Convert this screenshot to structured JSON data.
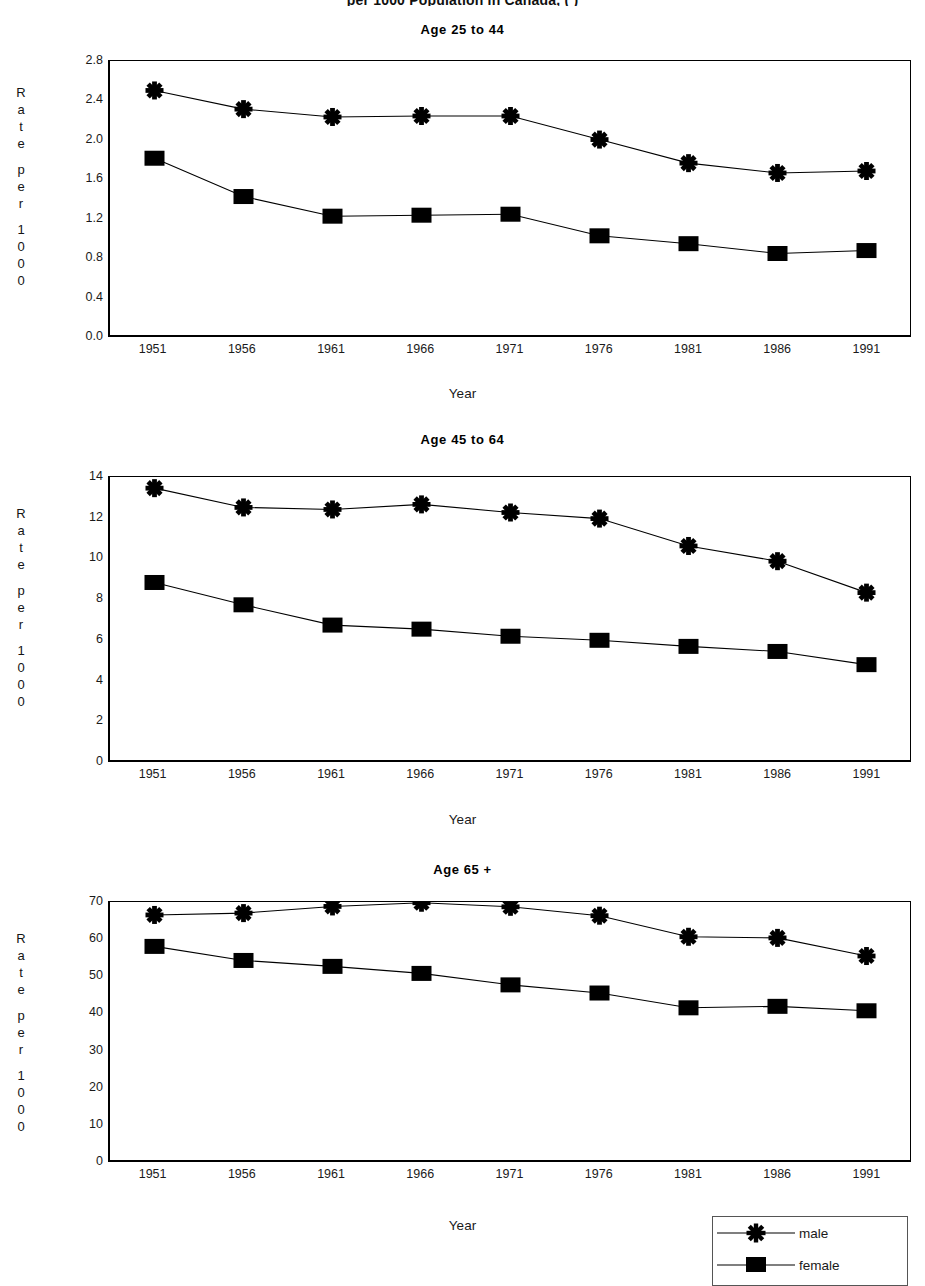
{
  "super_title": "per 1000 Population in Canada,                    (     )",
  "axis": {
    "y_label_letters": [
      "R",
      "a",
      "t",
      "e",
      "",
      "p",
      "e",
      "r",
      "",
      "1",
      "0",
      "0",
      "0"
    ],
    "x_label": "Year",
    "years": [
      "1951",
      "1956",
      "1961",
      "1966",
      "1971",
      "1976",
      "1981",
      "1986",
      "1991"
    ]
  },
  "legend": {
    "items": [
      {
        "label": "male",
        "marker": "star-marker"
      },
      {
        "label": "female",
        "marker": "square-marker"
      }
    ]
  },
  "chart_data": [
    {
      "type": "line",
      "title": "Age 25 to 44",
      "xlabel": "Year",
      "ylabel": "Rate per 1000",
      "x": [
        1951,
        1956,
        1961,
        1966,
        1971,
        1976,
        1981,
        1986,
        1991
      ],
      "categories": [
        "1951",
        "1956",
        "1961",
        "1966",
        "1971",
        "1976",
        "1981",
        "1986",
        "1991"
      ],
      "yticks": [
        "0.0",
        "0.4",
        "0.8",
        "1.2",
        "1.6",
        "2.0",
        "2.4",
        "2.8"
      ],
      "ylim": [
        0.0,
        2.8
      ],
      "grid": false,
      "legend_position": "bottom-right",
      "series": [
        {
          "name": "male",
          "marker": "star-marker",
          "values": [
            2.5,
            2.31,
            2.23,
            2.24,
            2.24,
            2.0,
            1.76,
            1.66,
            1.68
          ]
        },
        {
          "name": "female",
          "marker": "square-marker",
          "values": [
            1.81,
            1.42,
            1.22,
            1.23,
            1.24,
            1.02,
            0.94,
            0.84,
            0.87
          ]
        }
      ]
    },
    {
      "type": "line",
      "title": "Age 45 to 64",
      "xlabel": "Year",
      "ylabel": "Rate per 1000",
      "x": [
        1951,
        1956,
        1961,
        1966,
        1971,
        1976,
        1981,
        1986,
        1991
      ],
      "categories": [
        "1951",
        "1956",
        "1961",
        "1966",
        "1971",
        "1976",
        "1981",
        "1986",
        "1991"
      ],
      "yticks": [
        "0",
        "2",
        "4",
        "6",
        "8",
        "10",
        "12",
        "14"
      ],
      "ylim": [
        0,
        14
      ],
      "grid": false,
      "legend_position": "bottom-right",
      "series": [
        {
          "name": "male",
          "marker": "star-marker",
          "values": [
            13.45,
            12.5,
            12.4,
            12.65,
            12.25,
            11.95,
            10.6,
            9.85,
            8.3
          ]
        },
        {
          "name": "female",
          "marker": "square-marker",
          "values": [
            8.8,
            7.7,
            6.7,
            6.5,
            6.15,
            5.95,
            5.65,
            5.4,
            4.75
          ]
        }
      ]
    },
    {
      "type": "line",
      "title": "Age 65 +",
      "xlabel": "Year",
      "ylabel": "Rate per 1000",
      "x": [
        1951,
        1956,
        1961,
        1966,
        1971,
        1976,
        1981,
        1986,
        1991
      ],
      "categories": [
        "1951",
        "1956",
        "1961",
        "1966",
        "1971",
        "1976",
        "1981",
        "1986",
        "1991"
      ],
      "yticks": [
        "0",
        "10",
        "20",
        "30",
        "40",
        "50",
        "60",
        "70"
      ],
      "ylim": [
        0,
        70
      ],
      "grid": false,
      "legend_position": "bottom-right",
      "series": [
        {
          "name": "male",
          "marker": "star-marker",
          "values": [
            66.5,
            67.0,
            68.8,
            69.8,
            68.7,
            66.3,
            60.6,
            60.3,
            55.4
          ]
        },
        {
          "name": "female",
          "marker": "square-marker",
          "values": [
            58.0,
            54.2,
            52.6,
            50.7,
            47.6,
            45.4,
            41.4,
            41.8,
            40.6
          ]
        }
      ]
    }
  ]
}
